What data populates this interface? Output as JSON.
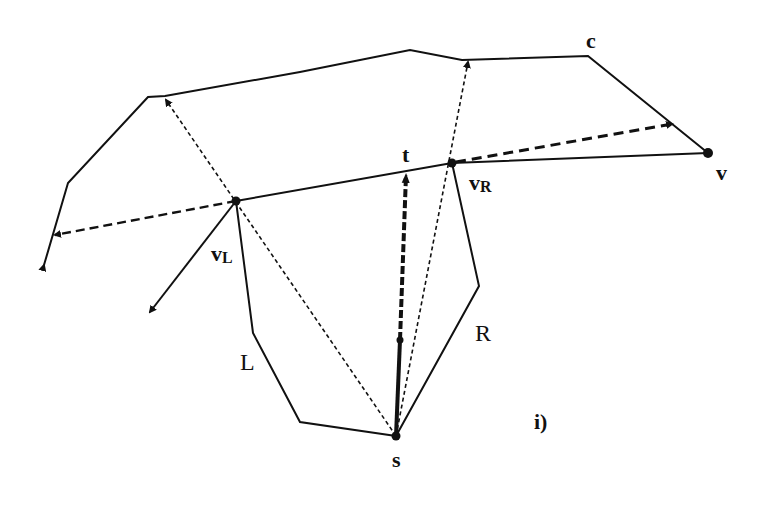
{
  "diagram": {
    "panel_label": "i)",
    "labels": {
      "c": "c",
      "t": "t",
      "v": "v",
      "vR_main": "v",
      "vR_sub": "R",
      "vL_main": "v",
      "vL_sub": "L",
      "L": "L",
      "R": "R",
      "s": "s"
    },
    "points": {
      "s": [
        396,
        436
      ],
      "t": [
        406,
        168
      ],
      "v_L": [
        236,
        201
      ],
      "v_R": [
        452,
        163
      ],
      "v": [
        708,
        153
      ],
      "c": [
        588,
        56
      ]
    },
    "colors": {
      "ink": "#111111",
      "background": "#ffffff"
    }
  }
}
